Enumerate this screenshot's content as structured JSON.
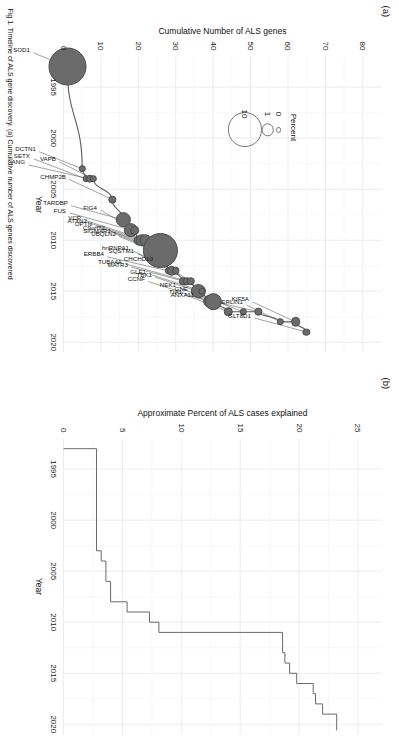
{
  "figure": {
    "caption_fragment": "Fig 1. Timeline of ALS gene discovery. (a) Cumulative number of ALS genes discovered",
    "panel_a_tag": "(a)",
    "panel_b_tag": "(b)"
  },
  "chart_data": [
    {
      "id": "panel-a",
      "type": "scatter",
      "title": "(a)",
      "xlabel": "Year",
      "ylabel": "Cumulative Number of ALS genes",
      "xlim": [
        1992,
        2021
      ],
      "ylim": [
        0,
        85
      ],
      "xticks": [
        1995,
        2000,
        2005,
        2010,
        2015,
        2020
      ],
      "yticks": [
        0,
        10,
        20,
        30,
        40,
        50,
        60,
        70,
        80
      ],
      "grid": true,
      "legend": {
        "title": "Percent",
        "position": "upper-left",
        "entries": [
          {
            "label": "0",
            "size": 0
          },
          {
            "label": "1",
            "size": 1
          },
          {
            "label": "10",
            "size": 10
          }
        ]
      },
      "points": [
        {
          "gene": "SOD1",
          "year": 1993,
          "cumulative": 1,
          "percent": 12.0
        },
        {
          "gene": "DCTN1",
          "year": 2003,
          "cumulative": 5,
          "percent": 0.2
        },
        {
          "gene": "SETX",
          "year": 2004,
          "cumulative": 6,
          "percent": 0.2
        },
        {
          "gene": "ANG",
          "year": 2004,
          "cumulative": 7,
          "percent": 0.3
        },
        {
          "gene": "VAPB",
          "year": 2004,
          "cumulative": 8,
          "percent": 0.2
        },
        {
          "gene": "CHMP2B",
          "year": 2006,
          "cumulative": 13,
          "percent": 0.3
        },
        {
          "gene": "TARDBP",
          "year": 2008,
          "cumulative": 16,
          "percent": 1.5
        },
        {
          "gene": "FUS",
          "year": 2009,
          "cumulative": 18,
          "percent": 1.5
        },
        {
          "gene": "FIG4",
          "year": 2009,
          "cumulative": 19,
          "percent": 0.5
        },
        {
          "gene": "OPTN",
          "year": 2010,
          "cumulative": 20,
          "percent": 0.6
        },
        {
          "gene": "ATXN2",
          "year": 2010,
          "cumulative": 21,
          "percent": 1.0
        },
        {
          "gene": "VCP",
          "year": 2010,
          "cumulative": 22,
          "percent": 1.0
        },
        {
          "gene": "UBQLN2",
          "year": 2011,
          "cumulative": 24,
          "percent": 0.5
        },
        {
          "gene": "SIGMAR1",
          "year": 2011,
          "cumulative": 25,
          "percent": 0.2
        },
        {
          "gene": "C9orf72",
          "year": 2011,
          "cumulative": 26,
          "percent": 10.0
        },
        {
          "gene": "ERBB4",
          "year": 2013,
          "cumulative": 28,
          "percent": 0.2
        },
        {
          "gene": "SQSTM1",
          "year": 2013,
          "cumulative": 29,
          "percent": 0.5
        },
        {
          "gene": "hnRNPA1",
          "year": 2013,
          "cumulative": 30,
          "percent": 0.3
        },
        {
          "gene": "MATR3",
          "year": 2014,
          "cumulative": 32,
          "percent": 0.4
        },
        {
          "gene": "TUBA4A",
          "year": 2014,
          "cumulative": 33,
          "percent": 0.4
        },
        {
          "gene": "CHCHD10",
          "year": 2014,
          "cumulative": 34,
          "percent": 0.4
        },
        {
          "gene": "TBK1",
          "year": 2015,
          "cumulative": 36,
          "percent": 1.5
        },
        {
          "gene": "GLE1",
          "year": 2015,
          "cumulative": 37,
          "percent": 0.3
        },
        {
          "gene": "CCNF",
          "year": 2016,
          "cumulative": 39,
          "percent": 1.2
        },
        {
          "gene": "NEK1",
          "year": 2016,
          "cumulative": 40,
          "percent": 2.0
        },
        {
          "gene": "TIA1",
          "year": 2017,
          "cumulative": 44,
          "percent": 0.4
        },
        {
          "gene": "GNE",
          "year": 2017,
          "cumulative": 48,
          "percent": 0.2
        },
        {
          "gene": "ANXA11",
          "year": 2017,
          "cumulative": 52,
          "percent": 0.3
        },
        {
          "gene": "ERLIN1",
          "year": 2018,
          "cumulative": 58,
          "percent": 0.2
        },
        {
          "gene": "KIF5A",
          "year": 2018,
          "cumulative": 62,
          "percent": 0.5
        },
        {
          "gene": "GLT8D1",
          "year": 2019,
          "cumulative": 65,
          "percent": 0.3
        }
      ]
    },
    {
      "id": "panel-b",
      "type": "line",
      "line_style": "step",
      "title": "(b)",
      "xlabel": "Year",
      "ylabel": "Approximate Percent of ALS cases explained",
      "xlim": [
        1992,
        2021
      ],
      "ylim": [
        0,
        27
      ],
      "xticks": [
        1995,
        2000,
        2005,
        2010,
        2015,
        2020
      ],
      "yticks": [
        0,
        5,
        10,
        15,
        20,
        25
      ],
      "grid": true,
      "x": [
        1993,
        2003,
        2004,
        2006,
        2008,
        2009,
        2010,
        2011,
        2013,
        2014,
        2015,
        2016,
        2017,
        2018,
        2019
      ],
      "y": [
        2.8,
        3.2,
        3.6,
        4.0,
        5.4,
        7.3,
        8.1,
        18.6,
        18.8,
        19.2,
        19.8,
        21.2,
        21.4,
        22.0,
        23.2
      ]
    }
  ]
}
